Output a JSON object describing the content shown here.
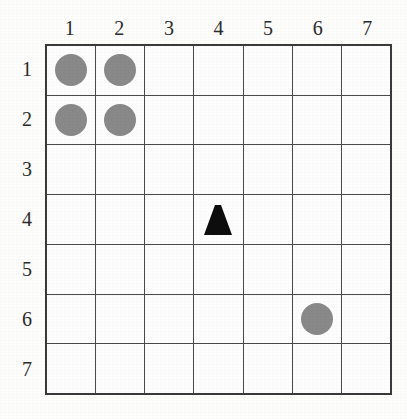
{
  "grid": {
    "rows": 7,
    "columns": 7,
    "column_headers": [
      "1",
      "2",
      "3",
      "4",
      "5",
      "6",
      "7"
    ],
    "row_headers": [
      "1",
      "2",
      "3",
      "4",
      "5",
      "6",
      "7"
    ],
    "colors": {
      "circle": "#898989",
      "triangle": "#0d0d0d",
      "grid_line": "#4a4a4a",
      "border": "#3a3a3a",
      "background": "#fdfdfd"
    },
    "tokens": [
      {
        "shape": "circle",
        "column": 1,
        "row": 1,
        "color": "#898989"
      },
      {
        "shape": "circle",
        "column": 2,
        "row": 1,
        "color": "#898989"
      },
      {
        "shape": "circle",
        "column": 1,
        "row": 2,
        "color": "#898989"
      },
      {
        "shape": "circle",
        "column": 2,
        "row": 2,
        "color": "#898989"
      },
      {
        "shape": "triangle",
        "column": 4,
        "row": 4,
        "color": "#0d0d0d"
      },
      {
        "shape": "circle",
        "column": 6,
        "row": 6,
        "color": "#898989"
      }
    ],
    "cells": [
      [
        "circle",
        "circle",
        "",
        "",
        "",
        "",
        ""
      ],
      [
        "circle",
        "circle",
        "",
        "",
        "",
        "",
        ""
      ],
      [
        "",
        "",
        "",
        "",
        "",
        "",
        ""
      ],
      [
        "",
        "",
        "",
        "triangle",
        "",
        "",
        ""
      ],
      [
        "",
        "",
        "",
        "",
        "",
        "",
        ""
      ],
      [
        "",
        "",
        "",
        "",
        "",
        "circle",
        ""
      ],
      [
        "",
        "",
        "",
        "",
        "",
        "",
        ""
      ]
    ]
  }
}
